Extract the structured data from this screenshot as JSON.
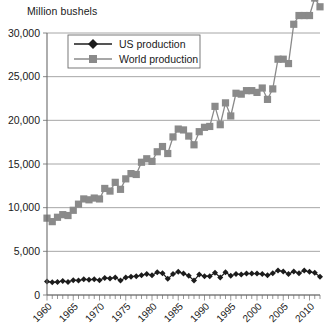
{
  "chart_data": {
    "type": "line",
    "title": "",
    "ylabel": "Million bushels",
    "xlabel": "",
    "ylim": [
      0,
      30000
    ],
    "xlim": [
      1960,
      2012
    ],
    "grid": true,
    "legend_position": "top-left",
    "ytick_labels": [
      "30,000",
      "25,000",
      "20,000",
      "15,000",
      "10,000",
      "5,000",
      "0"
    ],
    "ytick_values": [
      30000,
      25000,
      20000,
      15000,
      10000,
      5000,
      0
    ],
    "xtick_labels": [
      "1960",
      "1965",
      "1970",
      "1975",
      "1980",
      "1985",
      "1990",
      "1995",
      "2000",
      "2005",
      "2010"
    ],
    "xtick_values": [
      1960,
      1965,
      1970,
      1975,
      1980,
      1985,
      1990,
      1995,
      2000,
      2005,
      2010
    ],
    "x": [
      1960,
      1961,
      1962,
      1963,
      1964,
      1965,
      1966,
      1967,
      1968,
      1969,
      1970,
      1971,
      1972,
      1973,
      1974,
      1975,
      1976,
      1977,
      1978,
      1979,
      1980,
      1981,
      1982,
      1983,
      1984,
      1985,
      1986,
      1987,
      1988,
      1989,
      1990,
      1991,
      1992,
      1993,
      1994,
      1995,
      1996,
      1997,
      1998,
      1999,
      2000,
      2001,
      2002,
      2003,
      2004,
      2005,
      2006,
      2007,
      2008,
      2009,
      2010,
      2011,
      2012
    ],
    "series": [
      {
        "name": "US production",
        "marker": "diamond",
        "color": "#1c1c1c",
        "values": [
          1550,
          1450,
          1500,
          1600,
          1500,
          1700,
          1650,
          1800,
          1750,
          1800,
          1700,
          1950,
          1900,
          2000,
          1650,
          2000,
          2100,
          2150,
          2250,
          2400,
          2250,
          2600,
          2500,
          1850,
          2400,
          2650,
          2450,
          2200,
          1650,
          2350,
          2150,
          2150,
          2550,
          2000,
          2600,
          2200,
          2400,
          2350,
          2450,
          2450,
          2450,
          2400,
          2250,
          2500,
          2800,
          2700,
          2400,
          2700,
          2500,
          2800,
          2650,
          2550,
          2100
        ]
      },
      {
        "name": "World production",
        "marker": "square",
        "color": "#8a8a8a",
        "values": [
          8800,
          8400,
          8900,
          9200,
          9100,
          9700,
          10400,
          11000,
          10900,
          11100,
          11000,
          12200,
          11900,
          12900,
          12100,
          13300,
          13900,
          13800,
          15200,
          15600,
          15300,
          16400,
          17000,
          16200,
          18100,
          19000,
          18900,
          18200,
          17200,
          18700,
          19200,
          19300,
          21600,
          19500,
          22000,
          20500,
          23100,
          23000,
          23400,
          23400,
          23200,
          23700,
          22400,
          23600,
          27000,
          27000,
          26500,
          31000,
          32000,
          32000,
          32000,
          34000,
          33000
        ]
      }
    ]
  },
  "legend": {
    "entries": [
      {
        "label": "US production",
        "marker": "diamond",
        "color": "#1c1c1c"
      },
      {
        "label": "World production",
        "marker": "square",
        "color": "#8a8a8a"
      }
    ]
  }
}
